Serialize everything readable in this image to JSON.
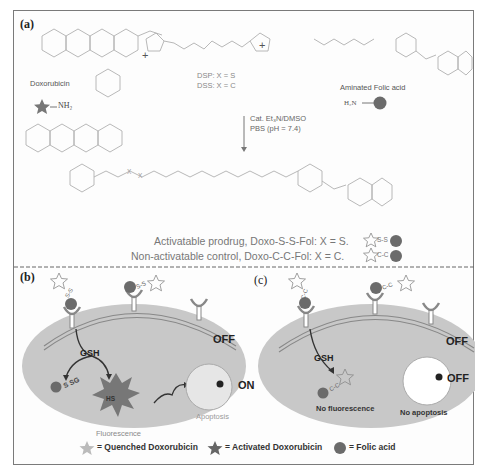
{
  "panels": {
    "a": {
      "label": "(a)",
      "reactants": {
        "doxorubicin": {
          "name": "Doxorubicin",
          "amine": "NH₂",
          "atoms": [
            "O",
            "OH",
            "O",
            "OH",
            "OH",
            "O",
            "O",
            "OH",
            "O",
            "O",
            "NH₂",
            "OH"
          ]
        },
        "linker": {
          "dsp": "DSP: X = S",
          "dss": "DSS: X = C"
        },
        "folic_acid": {
          "name": "Aminated Folic acid",
          "amine": "H₂N",
          "atoms": [
            "H₂N",
            "N",
            "O",
            "OH",
            "N",
            "H",
            "O",
            "N",
            "H",
            "N",
            "N",
            "OH",
            "N",
            "N",
            "NH₂"
          ]
        }
      },
      "plus_sign": "+",
      "conditions": {
        "line1": "Cat. Et₃N/DMSO",
        "line2": "PBS (pH = 7.4)"
      },
      "product_atoms": {
        "x1": "X",
        "x2": "X",
        "oh": "OH",
        "nh2": "NH₂"
      },
      "products": [
        {
          "text": "Activatable prodrug, Doxo-S-S-Fol: X = S.",
          "icon_link": "S-S"
        },
        {
          "text": "Non-activatable control, Doxo-C-C-Fol: X = C.",
          "icon_link": "C-C"
        }
      ]
    },
    "b": {
      "label": "(b)",
      "reagent": "GSH",
      "byproduct": "S SG",
      "thiol": "HS",
      "state_membrane": "OFF",
      "state_cell": "ON",
      "fluorescence": "Fluorescence",
      "apoptosis": "Apoptosis",
      "linker_label": "S-S"
    },
    "c": {
      "label": "(c)",
      "reagent": "GSH",
      "state_membrane": "OFF",
      "state_cell": "OFF",
      "fluorescence": "No fluorescence",
      "apoptosis": "No apoptosis",
      "linker_label": "C-C"
    }
  },
  "legend": [
    {
      "icon": "quenched-star-icon",
      "text": "= Quenched Doxorubicin"
    },
    {
      "icon": "activated-star-icon",
      "text": "= Activated Doxorubicin"
    },
    {
      "icon": "folic-acid-circle-icon",
      "text": "= Folic acid"
    }
  ],
  "colors": {
    "frame": "#7a7a7a",
    "cell": "#c8c8c8",
    "nucleus": "#e6e6e6",
    "folate": "#6b6b6b",
    "activated_star": "#777777",
    "text_dark": "#222222",
    "text_gray": "#8a8a8a"
  }
}
